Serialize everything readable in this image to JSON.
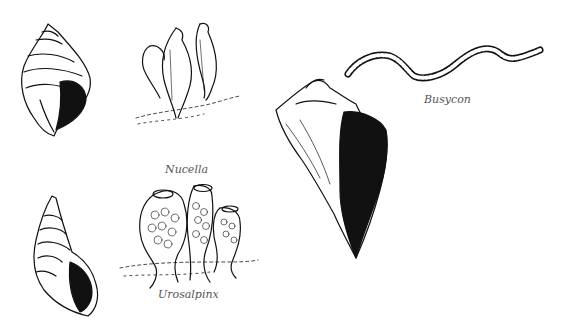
{
  "figure": {
    "species": [
      {
        "name": "Nucella",
        "caption_x": 165,
        "caption_y": 166
      },
      {
        "name": "Urosalpinx",
        "caption_x": 158,
        "caption_y": 291
      },
      {
        "name": "Busycon",
        "caption_x": 424,
        "caption_y": 96
      }
    ],
    "colors": {
      "ink": "#111111",
      "background": "#ffffff",
      "caption": "#555555"
    }
  }
}
